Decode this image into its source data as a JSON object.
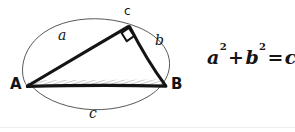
{
  "figure": {
    "kind": "hand-drawn-geometry-sketch",
    "background_color": "#ffffff",
    "ink_color": "#141414",
    "thin_ink_color": "#2b2b2b",
    "hatch_color": "#8a8a8a",
    "baseline_rule_color": "#e9e9e9"
  },
  "labels": {
    "vertex_left": "A",
    "vertex_right": "B",
    "vertex_apex": "c",
    "side_upper_left": "a",
    "side_upper_right": "b",
    "side_bottom": "c"
  },
  "equation": {
    "term_a": "a",
    "exp_a": "2",
    "plus": "+",
    "term_b": "b",
    "exp_b": "2",
    "equals": "=",
    "term_c": "c",
    "exp_c": "2",
    "plain_text": "a² + b² = c²"
  },
  "geometry": {
    "vertex_left_point": "27,86",
    "vertex_right_point": "166,86",
    "vertex_apex_point": "129,25",
    "right_angle_marker_at": "apex",
    "ellipse_center": "96,72",
    "ellipse_rx": "72",
    "ellipse_ry": "46",
    "ellipse_rotation_deg": "-8"
  }
}
